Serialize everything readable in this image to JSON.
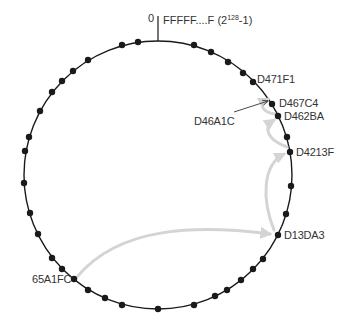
{
  "diagram": {
    "ring": {
      "cx": 158,
      "cy": 175,
      "r": 134,
      "stroke": "#1a1a1a"
    },
    "origin": {
      "zero_label": "0",
      "max_label_prefix": "FFFFF....F (2",
      "max_label_exp": "128",
      "max_label_suffix": "-1)"
    },
    "nodes": [
      {
        "x": 138,
        "y": 42
      },
      {
        "x": 122,
        "y": 45
      },
      {
        "x": 88,
        "y": 60
      },
      {
        "x": 73,
        "y": 71
      },
      {
        "x": 62,
        "y": 81
      },
      {
        "x": 52,
        "y": 92
      },
      {
        "x": 40,
        "y": 111
      },
      {
        "x": 29,
        "y": 137
      },
      {
        "x": 25,
        "y": 151
      },
      {
        "x": 24,
        "y": 183
      },
      {
        "x": 30,
        "y": 213
      },
      {
        "x": 38,
        "y": 234
      },
      {
        "x": 52,
        "y": 258
      },
      {
        "x": 62,
        "y": 269
      },
      {
        "x": 74,
        "y": 279
      },
      {
        "x": 88,
        "y": 290
      },
      {
        "x": 105,
        "y": 298
      },
      {
        "x": 122,
        "y": 305
      },
      {
        "x": 158,
        "y": 309
      },
      {
        "x": 194,
        "y": 305
      },
      {
        "x": 215,
        "y": 296
      },
      {
        "x": 227,
        "y": 290
      },
      {
        "x": 241,
        "y": 280
      },
      {
        "x": 253,
        "y": 269
      },
      {
        "x": 263,
        "y": 259
      },
      {
        "x": 278,
        "y": 235
      },
      {
        "x": 286,
        "y": 214
      },
      {
        "x": 291,
        "y": 186
      },
      {
        "x": 290,
        "y": 152
      },
      {
        "x": 287,
        "y": 137
      },
      {
        "x": 278,
        "y": 116
      },
      {
        "x": 272,
        "y": 104
      },
      {
        "x": 253,
        "y": 82
      },
      {
        "x": 243,
        "y": 73
      },
      {
        "x": 228,
        "y": 62
      },
      {
        "x": 211,
        "y": 52
      },
      {
        "x": 194,
        "y": 45
      }
    ],
    "labels": [
      {
        "text": "D471F1",
        "x": 257,
        "y": 73
      },
      {
        "text": "D467C4",
        "x": 279,
        "y": 97
      },
      {
        "text": "D462BA",
        "x": 284,
        "y": 110
      },
      {
        "text": "D4213F",
        "x": 296,
        "y": 146
      },
      {
        "text": "D13DA3",
        "x": 284,
        "y": 229
      },
      {
        "text": "65A1FC",
        "x": 32,
        "y": 273
      },
      {
        "text": "D46A1C",
        "x": 194,
        "y": 115
      }
    ],
    "lookup_path": [
      "65A1FC",
      "D13DA3",
      "D4213F",
      "D462BA",
      "D46A1C"
    ],
    "colors": {
      "node": "#1a1a1a",
      "arrow": "#d4d4d4",
      "text": "#333333"
    }
  }
}
